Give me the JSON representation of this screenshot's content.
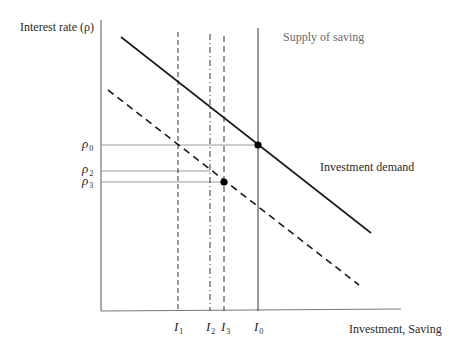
{
  "diagram": {
    "y_axis_label": "Interest rate (ρ)",
    "x_axis_label": "Investment, Saving",
    "supply_label": "Supply of saving",
    "demand_label": "Investment demand",
    "y_ticks": [
      {
        "sym": "ρ",
        "sub": "0"
      },
      {
        "sym": "ρ",
        "sub": "2"
      },
      {
        "sym": "ρ",
        "sub": "3"
      }
    ],
    "x_ticks": [
      {
        "sym": "I",
        "sub": "1"
      },
      {
        "sym": "I",
        "sub": "2"
      },
      {
        "sym": "I",
        "sub": "3"
      },
      {
        "sym": "I",
        "sub": "0"
      }
    ],
    "colors": {
      "axis": "#444444",
      "curve": "#1a1a1a",
      "guide": "#9a9a9a"
    }
  }
}
